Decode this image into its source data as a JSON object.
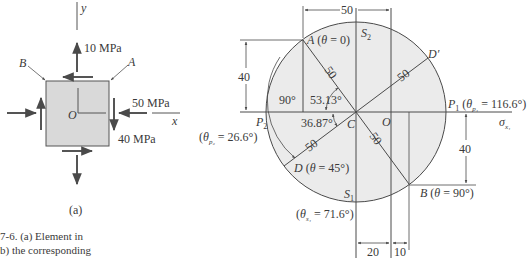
{
  "panel_a": {
    "axis_y_label": "y",
    "axis_x_label": "x",
    "origin_label": "O",
    "point_b_label": "B",
    "point_a_label": "A",
    "stress_y": "10 MPa",
    "stress_x": "50 MPa",
    "shear": "40 MPa",
    "panel_label": "(a)"
  },
  "caption": {
    "line1": "7-6. (a) Element in",
    "line2": "b) the corresponding"
  },
  "mohr_circle": {
    "center_label": "C",
    "origin_label": "O",
    "axis_label": "σ",
    "axis_sub": "x₁",
    "point_a": "A (θ = 0)",
    "point_b": "B (θ = 90°)",
    "point_d": "D (θ = 45°)",
    "point_d_prime": "D′",
    "point_s2": "S",
    "point_s2_sub": "2",
    "point_s1": "S",
    "point_s1_sub": "1",
    "point_p1": "P",
    "point_p1_sub": "1",
    "p1_angle": "(θ",
    "p1_angle_sub": "p₁",
    "p1_angle_val": " = 116.6°)",
    "point_p2": "P",
    "point_p2_sub": "2",
    "p2_angle": "(θ",
    "p2_angle_sub": "p₂",
    "p2_angle_val": " = 26.6°)",
    "s1_angle": "(θ",
    "s1_angle_sub": "s₁",
    "s1_angle_val": " = 71.6°)",
    "radius_label": "50",
    "angle_90": "90°",
    "angle_53": "53.13°",
    "angle_36": "36.87°",
    "dim_top": "50",
    "dim_left": "40",
    "dim_right": "40",
    "dim_bottom_1": "20",
    "dim_bottom_2": "10",
    "colors": {
      "fill": "#ebebeb",
      "line": "#4a4a4a"
    }
  }
}
